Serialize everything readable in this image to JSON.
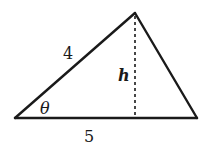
{
  "diagram": {
    "type": "triangle",
    "stroke_color": "#1a1a1a",
    "background": "#ffffff",
    "vertices": {
      "left": [
        15,
        118
      ],
      "apex": [
        135,
        13
      ],
      "right": [
        197,
        118
      ]
    },
    "labels": {
      "side_left": "4",
      "height": "h",
      "angle": "θ",
      "base": "5"
    },
    "altitude": {
      "style": "dashed",
      "x": 135,
      "y_top": 16,
      "y_bottom": 118
    }
  }
}
